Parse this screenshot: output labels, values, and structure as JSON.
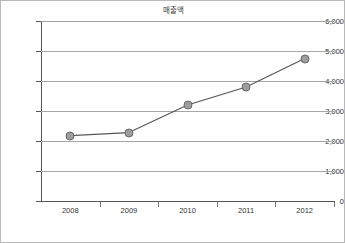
{
  "chart_data": {
    "type": "line",
    "title": "매출액",
    "xlabel": "",
    "ylabel": "",
    "categories": [
      "2008",
      "2009",
      "2010",
      "2011",
      "2012"
    ],
    "values": [
      2180,
      2280,
      3200,
      3800,
      4750
    ],
    "series": [
      {
        "name": "매출액",
        "values": [
          2180,
          2280,
          3200,
          3800,
          4750
        ]
      }
    ],
    "ylim": [
      0,
      6000
    ],
    "ytick_labels": [
      "6,000",
      "5,000",
      "4,000",
      "3,000",
      "2,000",
      "1,000",
      "0"
    ],
    "ytick_values": [
      6000,
      5000,
      4000,
      3000,
      2000,
      1000,
      0
    ],
    "grid": true,
    "legend": "none",
    "marker": "circle",
    "colors": {
      "line": "#555555",
      "marker_fill": "#9d9d9d",
      "marker_border": "#6a6a6a",
      "gridline": "#a6a6a6",
      "axis": "#555555",
      "text": "#333333",
      "frame": "#b9b9b9"
    }
  }
}
